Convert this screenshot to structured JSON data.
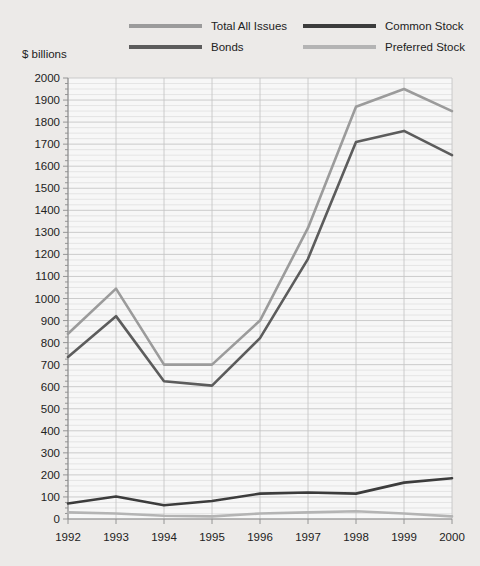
{
  "axis": {
    "y_title": "$ billions",
    "y_ticks": [
      "2000",
      "1900",
      "1800",
      "1700",
      "1600",
      "1500",
      "1400",
      "1300",
      "1200",
      "1100",
      "1000",
      "900",
      "800",
      "700",
      "600",
      "500",
      "400",
      "300",
      "200",
      "100",
      "0"
    ],
    "x_ticks": [
      "1992",
      "1993",
      "1994",
      "1995",
      "1996",
      "1997",
      "1998",
      "1999",
      "2000"
    ]
  },
  "legend": {
    "items": [
      {
        "label": "Total All Issues",
        "color": "#9b9b9b"
      },
      {
        "label": "Common Stock",
        "color": "#3c3c3c"
      },
      {
        "label": "Bonds",
        "color": "#5c5c5c"
      },
      {
        "label": "Preferred Stock",
        "color": "#b4b4b4"
      }
    ]
  },
  "colors": {
    "background": "#eceae8",
    "plot_background": "#f7f7f7",
    "gridline_minor": "#dcdcdc",
    "gridline_major": "#c6c6c6",
    "axis": "#8c8c8c",
    "total_all_issues": "#9b9b9b",
    "common_stock": "#3c3c3c",
    "bonds": "#5c5c5c",
    "preferred_stock": "#b4b4b4"
  },
  "chart_data": {
    "type": "line",
    "title": "",
    "xlabel": "",
    "ylabel": "$ billions",
    "categories": [
      "1992",
      "1993",
      "1994",
      "1995",
      "1996",
      "1997",
      "1998",
      "1999",
      "2000"
    ],
    "ylim": [
      0,
      2000
    ],
    "ytick_step": 100,
    "minor_gridlines": true,
    "grid": true,
    "legend_position": "top",
    "series": [
      {
        "name": "Total All Issues",
        "color": "#9b9b9b",
        "values": [
          840,
          1045,
          700,
          700,
          900,
          1320,
          1870,
          1950,
          1850
        ]
      },
      {
        "name": "Bonds",
        "color": "#5c5c5c",
        "values": [
          735,
          920,
          625,
          605,
          820,
          1180,
          1710,
          1760,
          1650
        ]
      },
      {
        "name": "Common Stock",
        "color": "#3c3c3c",
        "values": [
          70,
          102,
          62,
          82,
          115,
          120,
          115,
          165,
          185
        ]
      },
      {
        "name": "Preferred Stock",
        "color": "#b4b4b4",
        "values": [
          30,
          25,
          15,
          12,
          25,
          30,
          35,
          25,
          12
        ]
      }
    ]
  }
}
